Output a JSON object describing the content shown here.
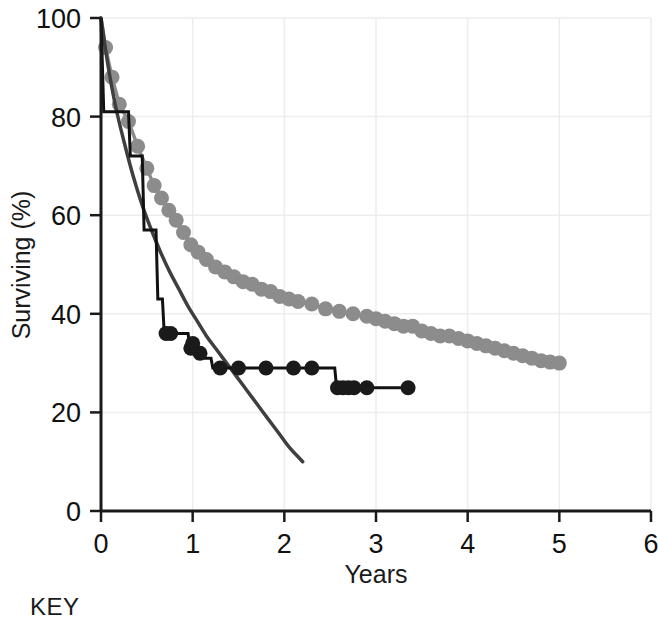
{
  "figure": {
    "key_label": "KEY",
    "background_color": "#ffffff"
  },
  "chart_data": {
    "type": "line",
    "title": "",
    "xlabel": "Years",
    "ylabel": "Surviving (%)",
    "xlim": [
      0,
      6
    ],
    "ylim": [
      0,
      100
    ],
    "xticks": [
      0,
      1,
      2,
      3,
      4,
      5,
      6
    ],
    "yticks": [
      0,
      20,
      40,
      60,
      80,
      100
    ],
    "xtick_labels": [
      "0",
      "1",
      "2",
      "3",
      "4",
      "5",
      "6"
    ],
    "ytick_labels": [
      "0",
      "20",
      "40",
      "60",
      "80",
      "100"
    ],
    "grid": true,
    "grid_color": "#ededed",
    "legend": "none",
    "axis_color": "#1a1a1a",
    "series": [
      {
        "name": "gray-marker-curve",
        "style": "line-with-circle-markers",
        "color": "#8c8c8c",
        "marker_color": "#8c8c8c",
        "marker_size": 11,
        "points": [
          [
            0.0,
            100.0
          ],
          [
            0.05,
            94.0
          ],
          [
            0.12,
            88.0
          ],
          [
            0.2,
            82.5
          ],
          [
            0.3,
            79.0
          ],
          [
            0.4,
            74.0
          ],
          [
            0.5,
            69.5
          ],
          [
            0.58,
            66.0
          ],
          [
            0.66,
            63.5
          ],
          [
            0.74,
            61.0
          ],
          [
            0.82,
            59.0
          ],
          [
            0.9,
            56.5
          ],
          [
            0.98,
            54.0
          ],
          [
            1.06,
            52.5
          ],
          [
            1.15,
            51.0
          ],
          [
            1.25,
            49.5
          ],
          [
            1.35,
            48.5
          ],
          [
            1.45,
            47.5
          ],
          [
            1.55,
            46.5
          ],
          [
            1.65,
            46.0
          ],
          [
            1.75,
            45.0
          ],
          [
            1.85,
            44.5
          ],
          [
            1.95,
            43.5
          ],
          [
            2.05,
            43.0
          ],
          [
            2.15,
            42.5
          ],
          [
            2.3,
            42.0
          ],
          [
            2.45,
            41.0
          ],
          [
            2.6,
            40.5
          ],
          [
            2.75,
            40.0
          ],
          [
            2.9,
            39.5
          ],
          [
            3.0,
            39.0
          ],
          [
            3.1,
            38.5
          ],
          [
            3.2,
            38.0
          ],
          [
            3.3,
            37.5
          ],
          [
            3.4,
            37.5
          ],
          [
            3.5,
            36.5
          ],
          [
            3.6,
            36.0
          ],
          [
            3.7,
            35.5
          ],
          [
            3.8,
            35.5
          ],
          [
            3.9,
            35.0
          ],
          [
            4.0,
            34.5
          ],
          [
            4.1,
            34.0
          ],
          [
            4.2,
            33.5
          ],
          [
            4.3,
            33.0
          ],
          [
            4.4,
            32.5
          ],
          [
            4.5,
            32.0
          ],
          [
            4.6,
            31.5
          ],
          [
            4.7,
            31.0
          ],
          [
            4.8,
            30.5
          ],
          [
            4.9,
            30.2
          ],
          [
            5.0,
            30.0
          ]
        ]
      },
      {
        "name": "dark-smooth-curve",
        "style": "smooth-line",
        "color": "#3f3f3f",
        "points": [
          [
            0.0,
            100.0
          ],
          [
            0.08,
            90.0
          ],
          [
            0.16,
            82.0
          ],
          [
            0.25,
            75.0
          ],
          [
            0.35,
            68.0
          ],
          [
            0.45,
            62.0
          ],
          [
            0.55,
            57.0
          ],
          [
            0.65,
            52.5
          ],
          [
            0.75,
            48.5
          ],
          [
            0.85,
            45.0
          ],
          [
            0.95,
            41.5
          ],
          [
            1.05,
            38.5
          ],
          [
            1.15,
            35.5
          ],
          [
            1.25,
            33.0
          ],
          [
            1.35,
            30.5
          ],
          [
            1.45,
            28.0
          ],
          [
            1.55,
            25.5
          ],
          [
            1.65,
            23.0
          ],
          [
            1.75,
            20.5
          ],
          [
            1.85,
            18.0
          ],
          [
            1.95,
            15.5
          ],
          [
            2.05,
            13.0
          ],
          [
            2.15,
            11.0
          ],
          [
            2.2,
            10.0
          ]
        ]
      },
      {
        "name": "black-step-curve",
        "style": "step-with-circle-markers",
        "color": "#111111",
        "marker_color": "#1a1a1a",
        "marker_size": 10,
        "step_points": [
          [
            0.0,
            100.0
          ],
          [
            0.03,
            81.0
          ],
          [
            0.3,
            81.0
          ],
          [
            0.32,
            72.0
          ],
          [
            0.45,
            72.0
          ],
          [
            0.47,
            57.0
          ],
          [
            0.6,
            57.0
          ],
          [
            0.62,
            43.0
          ],
          [
            0.67,
            43.0
          ],
          [
            0.69,
            36.0
          ],
          [
            0.95,
            36.0
          ],
          [
            0.97,
            33.0
          ],
          [
            1.03,
            33.0
          ],
          [
            1.05,
            31.0
          ],
          [
            1.2,
            31.0
          ],
          [
            1.22,
            29.0
          ],
          [
            2.55,
            29.0
          ],
          [
            2.57,
            25.0
          ],
          [
            3.38,
            25.0
          ]
        ],
        "censor_markers": [
          [
            0.71,
            36.0
          ],
          [
            0.76,
            36.0
          ],
          [
            0.98,
            33.0
          ],
          [
            1.0,
            34.0
          ],
          [
            1.08,
            32.0
          ],
          [
            1.3,
            29.0
          ],
          [
            1.5,
            29.0
          ],
          [
            1.8,
            29.0
          ],
          [
            2.1,
            29.0
          ],
          [
            2.3,
            29.0
          ],
          [
            2.58,
            25.0
          ],
          [
            2.64,
            25.0
          ],
          [
            2.7,
            25.0
          ],
          [
            2.76,
            25.0
          ],
          [
            2.9,
            25.0
          ],
          [
            3.35,
            25.0
          ]
        ]
      }
    ]
  }
}
